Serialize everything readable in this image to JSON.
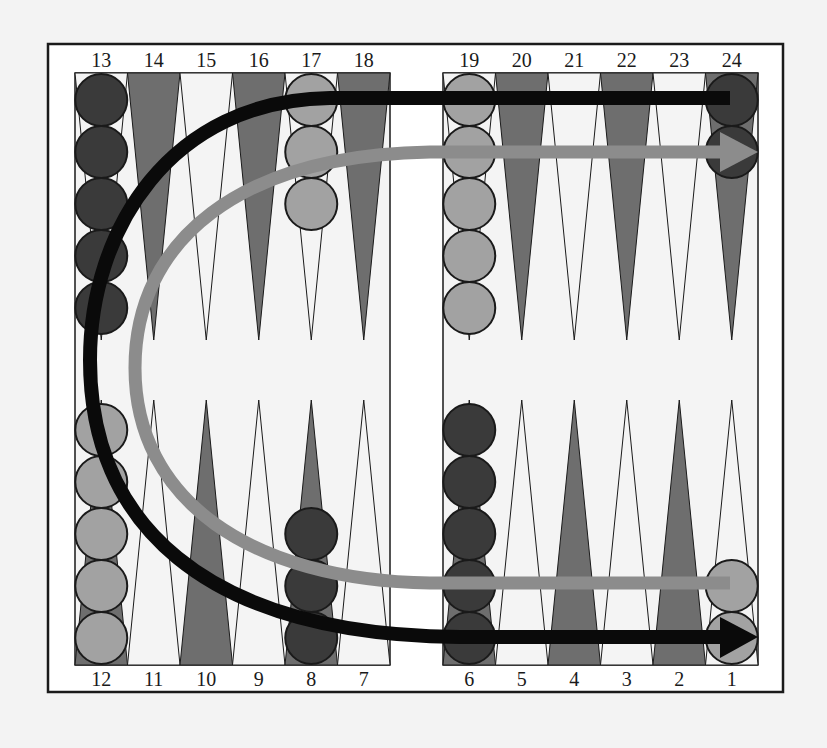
{
  "diagram": {
    "colors": {
      "background": "#f3f3f3",
      "board": "#ffffff",
      "point_light": "#f4f4f4",
      "point_dark": "#6e6e6e",
      "checker_dark": "#3a3a3a",
      "checker_light": "#a2a2a2",
      "outline": "#1a1a1a",
      "arrow_dark": "#0a0a0a",
      "arrow_light": "#8c8c8c"
    },
    "top_labels": [
      "13",
      "14",
      "15",
      "16",
      "17",
      "18",
      "19",
      "20",
      "21",
      "22",
      "23",
      "24"
    ],
    "bottom_labels": [
      "12",
      "11",
      "10",
      "9",
      "8",
      "7",
      "6",
      "5",
      "4",
      "3",
      "2",
      "1"
    ],
    "top_point_shades": [
      "light",
      "dark",
      "light",
      "dark",
      "light",
      "dark",
      "light",
      "dark",
      "light",
      "dark",
      "light",
      "dark"
    ],
    "bottom_point_shades": [
      "dark",
      "light",
      "dark",
      "light",
      "dark",
      "light",
      "dark",
      "light",
      "dark",
      "light",
      "dark",
      "light"
    ],
    "checkers": [
      {
        "point": 13,
        "color": "dark",
        "count": 5
      },
      {
        "point": 17,
        "color": "light",
        "count": 3
      },
      {
        "point": 19,
        "color": "light",
        "count": 5
      },
      {
        "point": 24,
        "color": "dark",
        "count": 2
      },
      {
        "point": 12,
        "color": "light",
        "count": 5
      },
      {
        "point": 8,
        "color": "dark",
        "count": 3
      },
      {
        "point": 6,
        "color": "dark",
        "count": 5
      },
      {
        "point": 1,
        "color": "light",
        "count": 2
      }
    ],
    "arrows": [
      {
        "name": "dark-player-path",
        "color": "dark",
        "from_point": 24,
        "to_point": 1
      },
      {
        "name": "light-player-path",
        "color": "light",
        "from_point": 1,
        "to_point": 24
      }
    ]
  }
}
